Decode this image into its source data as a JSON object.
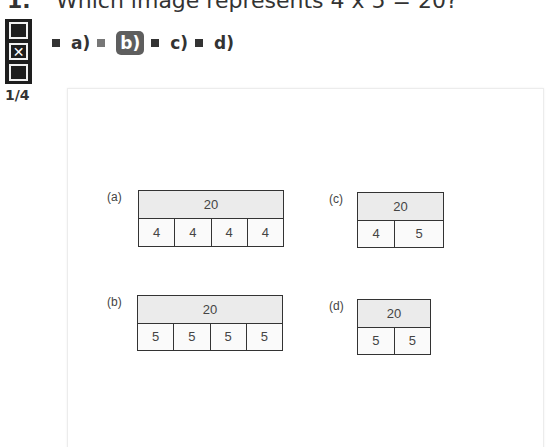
{
  "question": {
    "number": "1.",
    "text": "Which image represents 4 x 5 = 20?"
  },
  "navigation": {
    "boxes": [
      {
        "state": "empty",
        "glyph": ""
      },
      {
        "state": "checked",
        "glyph": "✕"
      },
      {
        "state": "empty",
        "glyph": ""
      }
    ],
    "page_indicator": "1/4"
  },
  "options": [
    {
      "label": "a)",
      "selected": false
    },
    {
      "label": "b)",
      "selected": true
    },
    {
      "label": "c)",
      "selected": false
    },
    {
      "label": "d)",
      "selected": false
    }
  ],
  "figure": {
    "diagrams": [
      {
        "label": "(a)",
        "total": "20",
        "parts": [
          "4",
          "4",
          "4",
          "4"
        ]
      },
      {
        "label": "(b)",
        "total": "20",
        "parts": [
          "5",
          "5",
          "5",
          "5"
        ]
      },
      {
        "label": "(c)",
        "total": "20",
        "parts": [
          "4",
          "5"
        ]
      },
      {
        "label": "(d)",
        "total": "20",
        "parts": [
          "5",
          "5"
        ]
      }
    ]
  },
  "colors": {
    "selected_badge": "#5e5e5e",
    "total_fill": "#ebebeb",
    "widget_bg": "#1e1e1e"
  }
}
